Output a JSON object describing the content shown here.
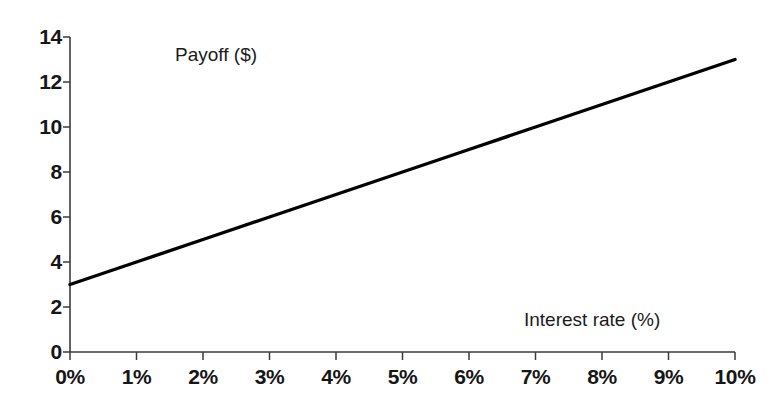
{
  "chart_data": {
    "type": "line",
    "title": "",
    "subtitle": "",
    "xlabel": "Interest rate (%)",
    "ylabel": "Payoff ($)",
    "xlim": [
      0,
      10
    ],
    "ylim": [
      0,
      14
    ],
    "grid": false,
    "legend": null,
    "x_tick_labels": [
      "0%",
      "1%",
      "2%",
      "3%",
      "4%",
      "5%",
      "6%",
      "7%",
      "8%",
      "9%",
      "10%"
    ],
    "x_tick_values": [
      0,
      1,
      2,
      3,
      4,
      5,
      6,
      7,
      8,
      9,
      10
    ],
    "y_tick_labels": [
      "0",
      "2",
      "4",
      "6",
      "8",
      "10",
      "12",
      "14"
    ],
    "y_tick_values": [
      0,
      2,
      4,
      6,
      8,
      10,
      12,
      14
    ],
    "series": [
      {
        "name": "Payoff",
        "color": "#000000",
        "x": [
          0,
          1,
          2,
          3,
          4,
          5,
          6,
          7,
          8,
          9,
          10
        ],
        "values": [
          3,
          4,
          5,
          6,
          7,
          8,
          9,
          10,
          11,
          12,
          13
        ]
      }
    ],
    "annotations": []
  },
  "labels": {
    "y_axis_title": "Payoff ($)",
    "x_axis_title": "Interest rate (%)"
  },
  "colors": {
    "background": "#ffffff",
    "axis": "#3b3b3b",
    "line": "#000000",
    "text": "#161616"
  }
}
